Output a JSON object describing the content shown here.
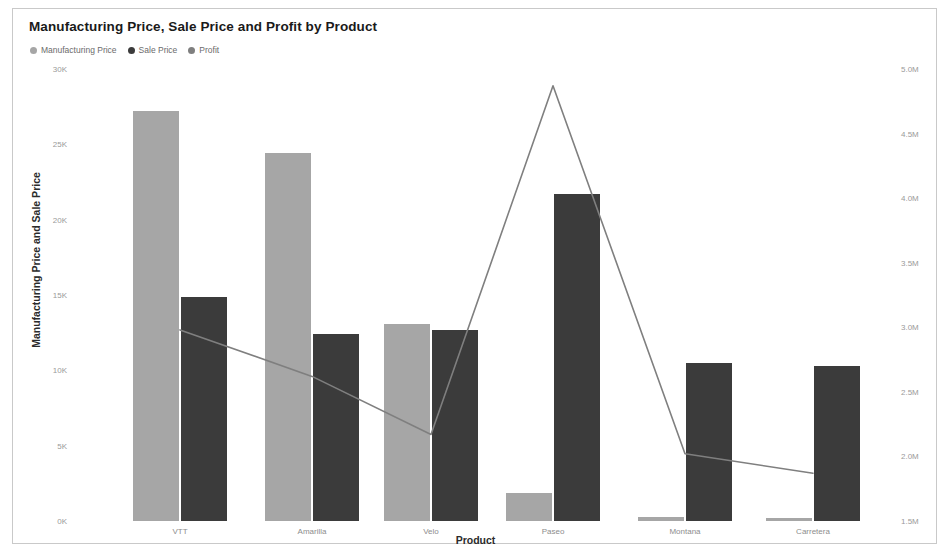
{
  "chart": {
    "title": "Manufacturing Price, Sale Price and Profit by Product",
    "xlabel": "Product",
    "ylabel_left": "Manufacturing Price and Sale Price",
    "ylabel_right": "",
    "legend": [
      {
        "label": "Manufacturing Price",
        "color": "#a6a6a6",
        "marker": "circle"
      },
      {
        "label": "Sale Price",
        "color": "#3b3b3b",
        "marker": "circle"
      },
      {
        "label": "Profit",
        "color": "#7f7f7f",
        "marker": "circle"
      }
    ]
  },
  "chart_data": {
    "type": "bar",
    "title": "Manufacturing Price, Sale Price and Profit by Product",
    "xlabel": "Product",
    "ylabel": "Manufacturing Price and Sale Price",
    "ylabel_secondary": "Profit",
    "grid": false,
    "legend_position": "top-left",
    "categories": [
      "VTT",
      "Amarilla",
      "Velo",
      "Paseo",
      "Montana",
      "Carretera"
    ],
    "series": [
      {
        "name": "Manufacturing Price",
        "type": "bar",
        "axis": "left",
        "color": "#a6a6a6",
        "values": [
          27200,
          24400,
          13100,
          1850,
          250,
          200
        ]
      },
      {
        "name": "Sale Price",
        "type": "bar",
        "axis": "left",
        "color": "#3b3b3b",
        "values": [
          14900,
          12400,
          12700,
          21700,
          10500,
          10300
        ]
      },
      {
        "name": "Profit",
        "type": "line",
        "axis": "right",
        "color": "#7f7f7f",
        "values": [
          2980000,
          2620000,
          2170000,
          4870000,
          2020000,
          1870000
        ]
      }
    ],
    "axis_left": {
      "min": 0,
      "max": 30000,
      "ticks": [
        0,
        5000,
        10000,
        15000,
        20000,
        25000,
        30000
      ],
      "ticklabels": [
        "0K",
        "5K",
        "10K",
        "15K",
        "20K",
        "25K",
        "30K"
      ]
    },
    "axis_right": {
      "min": 1500000,
      "max": 5000000,
      "ticks": [
        1500000,
        2000000,
        2500000,
        3000000,
        3500000,
        4000000,
        4500000,
        5000000
      ],
      "ticklabels": [
        "1.5M",
        "2.0M",
        "2.5M",
        "3.0M",
        "3.5M",
        "4.0M",
        "4.5M",
        "5.0M"
      ]
    }
  },
  "geometry": {
    "plot_top": 60,
    "plot_bottom": 512,
    "group_centers": [
      167,
      299,
      418,
      540,
      672,
      800
    ],
    "bar_width": 46,
    "bar_gap": 2
  }
}
